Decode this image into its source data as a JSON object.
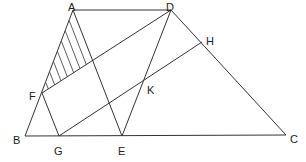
{
  "figure": {
    "type": "geometry-diagram",
    "line_color": "#333333",
    "points": {
      "A": {
        "label": "A",
        "x": 73,
        "y": 10,
        "lx": 68,
        "ly": 7
      },
      "D": {
        "label": "D",
        "x": 171,
        "y": 10,
        "lx": 166,
        "ly": 7
      },
      "H": {
        "label": "H",
        "x": 202,
        "y": 42,
        "lx": 206,
        "ly": 41
      },
      "K": {
        "label": "K",
        "x": 144,
        "y": 80,
        "lx": 147,
        "ly": 90
      },
      "F": {
        "label": "F",
        "x": 42,
        "y": 93,
        "lx": 29,
        "ly": 96
      },
      "B": {
        "label": "B",
        "x": 25,
        "y": 136,
        "lx": 13,
        "ly": 140
      },
      "G": {
        "label": "G",
        "x": 59,
        "y": 136,
        "lx": 54,
        "ly": 151
      },
      "E": {
        "label": "E",
        "x": 122,
        "y": 136,
        "lx": 118,
        "ly": 151
      },
      "C": {
        "label": "C",
        "x": 286,
        "y": 135,
        "lx": 290,
        "ly": 139
      }
    },
    "segments": [
      [
        "A",
        "D"
      ],
      [
        "A",
        "B"
      ],
      [
        "B",
        "C"
      ],
      [
        "D",
        "C"
      ],
      [
        "A",
        "E"
      ],
      [
        "D",
        "E"
      ],
      [
        "F",
        "D"
      ],
      [
        "F",
        "G"
      ],
      [
        "G",
        "H"
      ]
    ],
    "shaded_region": {
      "description": "triangle AFP hatched, P = intersection of AE and FD",
      "vertices": [
        "A",
        "F",
        "P"
      ],
      "P": {
        "x": 92.6,
        "y": 60.4
      },
      "hatch_count": 7
    }
  }
}
